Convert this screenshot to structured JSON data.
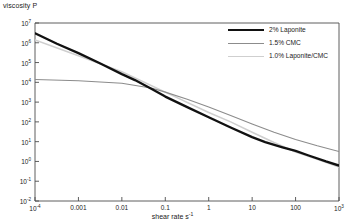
{
  "chart_data": {
    "type": "line",
    "title": "",
    "ylabel": "viscosity P",
    "xlabel": "shear rate s",
    "xlabel_sup": "-1",
    "xscale": "log",
    "yscale": "log",
    "xlim": [
      0.0001,
      1000
    ],
    "ylim": [
      0.01,
      10000000
    ],
    "grid": false,
    "legend_position": "top-right",
    "xticks": [
      {
        "value": 0.0001,
        "label": "10",
        "sup": "-4"
      },
      {
        "value": 0.001,
        "label": "0.001",
        "sup": ""
      },
      {
        "value": 0.01,
        "label": "0.01",
        "sup": ""
      },
      {
        "value": 0.1,
        "label": "0.1",
        "sup": ""
      },
      {
        "value": 1,
        "label": "1",
        "sup": ""
      },
      {
        "value": 10,
        "label": "10",
        "sup": ""
      },
      {
        "value": 100,
        "label": "100",
        "sup": ""
      },
      {
        "value": 1000,
        "label": "10",
        "sup": "3"
      }
    ],
    "yticks": [
      {
        "value": 10000000,
        "label": "10",
        "sup": "7"
      },
      {
        "value": 1000000,
        "label": "10",
        "sup": "6"
      },
      {
        "value": 100000,
        "label": "10",
        "sup": "5"
      },
      {
        "value": 10000,
        "label": "10",
        "sup": "4"
      },
      {
        "value": 1000,
        "label": "10",
        "sup": "3"
      },
      {
        "value": 100,
        "label": "10",
        "sup": "2"
      },
      {
        "value": 10,
        "label": "10",
        "sup": "1"
      },
      {
        "value": 1,
        "label": "10",
        "sup": "0"
      },
      {
        "value": 0.1,
        "label": "10",
        "sup": "-1"
      },
      {
        "value": 0.01,
        "label": "10",
        "sup": "-2"
      }
    ],
    "series": [
      {
        "name": "2% Laponite",
        "color": "#111111",
        "width": 2.3,
        "points": [
          [
            0.0001,
            3000000
          ],
          [
            0.00032,
            900000
          ],
          [
            0.001,
            300000
          ],
          [
            0.0032,
            90000
          ],
          [
            0.01,
            26000
          ],
          [
            0.02,
            13000
          ],
          [
            0.05,
            4500
          ],
          [
            0.1,
            1900
          ],
          [
            0.32,
            560
          ],
          [
            1,
            170
          ],
          [
            3.2,
            52
          ],
          [
            10,
            17
          ],
          [
            20,
            9.5
          ],
          [
            50,
            5.2
          ],
          [
            100,
            3.4
          ],
          [
            200,
            2.0
          ],
          [
            500,
            1.0
          ],
          [
            1000,
            0.62
          ]
        ]
      },
      {
        "name": "1.5% CMC",
        "color": "#8c8c8c",
        "width": 1.1,
        "points": [
          [
            0.0001,
            14000
          ],
          [
            0.001,
            12000
          ],
          [
            0.01,
            9000
          ],
          [
            0.05,
            5000
          ],
          [
            0.1,
            3200
          ],
          [
            0.32,
            1400
          ],
          [
            1,
            560
          ],
          [
            3.2,
            210
          ],
          [
            10,
            78
          ],
          [
            32,
            30
          ],
          [
            100,
            13
          ],
          [
            316,
            6.2
          ],
          [
            1000,
            3.2
          ]
        ]
      },
      {
        "name": "1.0% Laponite/CMC",
        "color": "#cfcfcf",
        "width": 1.6,
        "points": [
          [
            0.0001,
            1400000
          ],
          [
            0.001,
            220000
          ],
          [
            0.01,
            34000
          ],
          [
            0.1,
            3200
          ],
          [
            1,
            300
          ],
          [
            3.2,
            100
          ],
          [
            10,
            30
          ],
          [
            32,
            9.0
          ],
          [
            100,
            3.0
          ],
          [
            316,
            1.3
          ],
          [
            1000,
            0.52
          ]
        ]
      }
    ]
  },
  "legend": {
    "items": [
      {
        "label": "2% Laponite"
      },
      {
        "label": "1.5% CMC"
      },
      {
        "label": "1.0% Laponite/CMC"
      }
    ]
  },
  "axis_color": "#4d4d4d"
}
